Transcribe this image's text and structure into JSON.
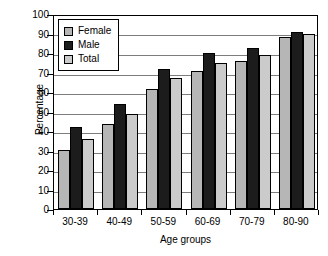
{
  "chart_data": {
    "type": "bar",
    "title": "",
    "xlabel": "Age groups",
    "ylabel": "Percentage",
    "categories": [
      "30-39",
      "40-49",
      "50-59",
      "60-69",
      "70-79",
      "80-90"
    ],
    "series": [
      {
        "name": "Female",
        "color": "#b6b6b6",
        "values": [
          30,
          43.5,
          61.5,
          71,
          76,
          88
        ]
      },
      {
        "name": "Male",
        "color": "#1c1c1c",
        "values": [
          42,
          54,
          72,
          80,
          82.5,
          91
        ]
      },
      {
        "name": "Total",
        "color": "#cbcbcb",
        "values": [
          36,
          48.5,
          67,
          75,
          79,
          89.5
        ]
      }
    ],
    "ylim": [
      0,
      100
    ],
    "yticks": [
      0,
      10,
      20,
      30,
      40,
      50,
      60,
      70,
      80,
      90,
      100
    ],
    "ytick_labels": [
      "0",
      "10",
      "20",
      "30",
      "40",
      "50",
      "60",
      "70",
      "80",
      "90",
      "100"
    ],
    "grid": true,
    "grid_axis": "y",
    "legend_position": "top-left",
    "legend_entries": [
      "Female",
      "Male",
      "Total"
    ]
  }
}
